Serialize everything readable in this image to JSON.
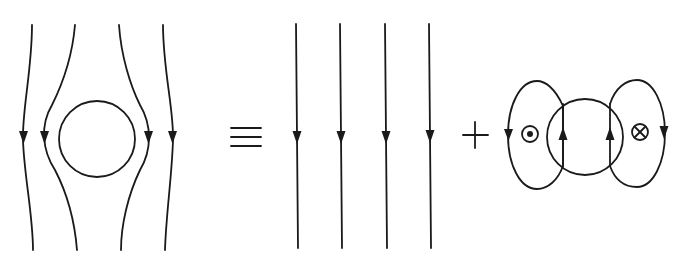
{
  "diagram": {
    "operators": {
      "equivalence": "≡",
      "plus": "+"
    },
    "panels": [
      {
        "name": "distorted-field",
        "elements": [
          "circle",
          "4 field lines bending around circle",
          "downward arrows"
        ]
      },
      {
        "name": "uniform-field",
        "elements": [
          "4 straight vertical field lines",
          "downward arrows"
        ]
      },
      {
        "name": "dipole-field",
        "elements": [
          "circle",
          "2 loops",
          "out-of-page symbol (⊙)",
          "into-page symbol (⊗)",
          "upward arrows inside circle",
          "downward arrows on outer loops"
        ]
      }
    ],
    "symbols": {
      "out_of_page": "⊙",
      "into_page": "⊗"
    },
    "stroke_color": "#1a1a1a",
    "background": "#ffffff"
  }
}
